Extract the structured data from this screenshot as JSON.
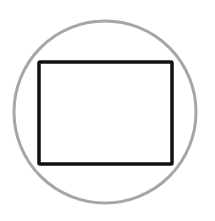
{
  "figure": {
    "circle": {
      "cx": 105,
      "cy": 112,
      "r": 91,
      "stroke": "#a6a6a6",
      "stroke_width": 3
    },
    "rectangle": {
      "x": 39,
      "y": 62,
      "width": 133,
      "height": 102,
      "stroke": "#111111",
      "stroke_width": 3.5,
      "corner_radius": 1
    },
    "background": "#ffffff"
  }
}
